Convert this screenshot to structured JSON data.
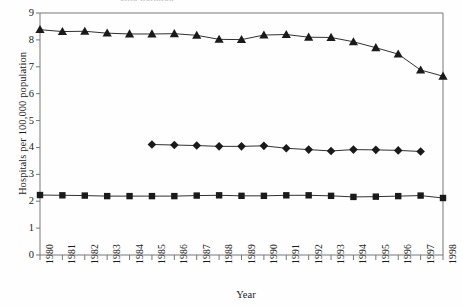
{
  "figure": {
    "cut_title_fragment": "ollia  ilorniion",
    "background_color": "#fefefe",
    "ink_color": "#1a1a1a",
    "axis_color": "#777777"
  },
  "chart_data": {
    "type": "line",
    "title": "",
    "xlabel": "Year",
    "ylabel": "Hospitals per 100,000 population",
    "x": [
      1980,
      1981,
      1982,
      1983,
      1984,
      1985,
      1986,
      1987,
      1988,
      1989,
      1990,
      1991,
      1992,
      1993,
      1994,
      1995,
      1996,
      1997,
      1998
    ],
    "xtick_labels": [
      "1980",
      "1981",
      "1982",
      "1983",
      "1984",
      "1985",
      "1986",
      "1987",
      "1988",
      "1989",
      "1990",
      "1991",
      "1992",
      "1993",
      "1994",
      "1995",
      "1996",
      "1997",
      "1998"
    ],
    "ytick_labels": [
      "0",
      "1",
      "2",
      "3",
      "4",
      "5",
      "6",
      "7",
      "8",
      "9"
    ],
    "ylim": [
      0,
      9
    ],
    "xlim": [
      1980,
      1998
    ],
    "grid": false,
    "legend": "none",
    "series": [
      {
        "name": "triangle-series",
        "marker": "triangle",
        "color": "#1a1a1a",
        "values": [
          8.38,
          8.31,
          8.32,
          8.25,
          8.22,
          8.22,
          8.23,
          8.17,
          8.02,
          8.01,
          8.18,
          8.2,
          8.1,
          8.09,
          7.93,
          7.71,
          7.47,
          6.88,
          6.65
        ]
      },
      {
        "name": "diamond-series",
        "marker": "diamond",
        "color": "#1a1a1a",
        "values": [
          null,
          null,
          null,
          null,
          null,
          4.11,
          4.09,
          4.07,
          4.04,
          4.04,
          4.06,
          3.97,
          3.92,
          3.87,
          3.92,
          3.91,
          3.89,
          3.85,
          null
        ]
      },
      {
        "name": "square-series",
        "marker": "square",
        "color": "#1a1a1a",
        "values": [
          2.23,
          2.22,
          2.21,
          2.19,
          2.19,
          2.19,
          2.19,
          2.21,
          2.22,
          2.2,
          2.2,
          2.22,
          2.22,
          2.2,
          2.16,
          2.17,
          2.19,
          2.21,
          2.12
        ]
      }
    ]
  }
}
